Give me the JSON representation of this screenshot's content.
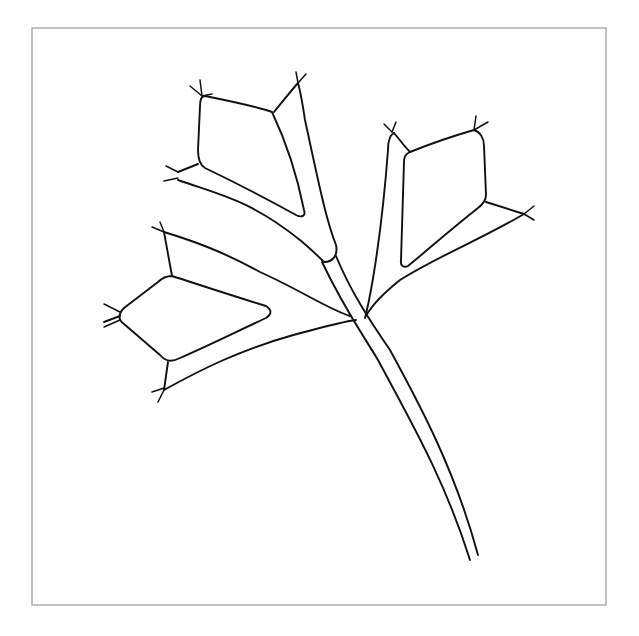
{
  "canvas": {
    "width": 639,
    "height": 636,
    "background": "#ffffff"
  },
  "frame": {
    "x": 32,
    "y": 28,
    "width": 574,
    "height": 577,
    "stroke": "#9a9a9a"
  },
  "drawing": {
    "subject": "line-drawing-of-plant-sprig-with-three-leaves",
    "ink_color": "#111111",
    "paths": {
      "stem_left": "M322 262 C345 310 360 330 378 360 C410 420 445 480 470 560",
      "stem_right": "M336 256 C350 290 368 318 390 350 C420 405 455 470 478 555",
      "upper_leaf_outer": "M178 180 C220 195 250 200 300 240 C312 250 320 258 324 262 C334 262 338 254 336 245 C326 220 318 180 305 120 C302 100 300 90 298 83",
      "upper_leaf_top_edge": "M298 83 C290 92 284 100 274 112",
      "upper_leaf_inner": "M205 96 C235 102 255 106 272 112 C290 150 300 190 304 210 C306 216 302 218 296 215 C260 195 230 180 205 168 C200 165 198 160 198 150 L200 106 C200 99 202 96 205 96 Z",
      "upper_leaf_left_join": "M198 164 L178 172",
      "right_leaf_outer": "M365 318 C372 290 382 230 388 150 C388 140 390 135 394 133",
      "right_leaf_top_edge": "M394 133 C400 140 404 146 410 152",
      "right_leaf_inner": "M410 152 C440 140 460 134 474 130 C480 132 484 138 484 146 L486 195 C486 200 482 205 478 208 C450 230 430 248 408 266 C404 268 400 266 401 260 L404 162 C404 156 406 154 410 152 Z",
      "right_leaf_right_join": "M486 202 L524 214",
      "right_leaf_lower_edge": "M524 214 C480 240 440 255 400 280 C385 292 372 305 366 316",
      "left_leaf_upper_edge": "M164 232 C190 240 220 250 260 272 C300 290 330 310 350 316",
      "left_leaf_upper_join": "M164 232 L172 276",
      "left_leaf_inner": "M172 276 C200 285 230 295 266 306 C272 310 272 314 266 318 C240 330 210 345 180 358 C172 362 166 362 160 355 L124 324 C118 320 118 314 124 308 L158 282 C162 278 166 276 172 276 Z",
      "left_leaf_lower_join": "M168 362 L164 390",
      "left_leaf_lower_edge": "M164 390 C200 370 240 350 290 336 C320 328 340 322 356 320",
      "left_leaf_left_join": "M120 316 L104 322"
    },
    "tips": [
      {
        "name": "upper-leaf-top-left-tip",
        "lines": [
          "M202 96 L190 86",
          "M202 96 L200 80",
          "M202 96 L212 94"
        ]
      },
      {
        "name": "upper-leaf-top-right-tip",
        "lines": [
          "M298 83 L296 72",
          "M298 83 L306 74"
        ]
      },
      {
        "name": "upper-leaf-left-tip",
        "lines": [
          "M178 172 L166 166",
          "M178 178 L164 181"
        ]
      },
      {
        "name": "right-leaf-top-left-tip",
        "lines": [
          "M392 132 L384 124",
          "M392 132 L396 122"
        ]
      },
      {
        "name": "right-leaf-top-right-tip",
        "lines": [
          "M474 130 L476 116",
          "M474 130 L488 122"
        ]
      },
      {
        "name": "right-leaf-right-tip",
        "lines": [
          "M524 214 L534 206",
          "M524 214 L534 220"
        ]
      },
      {
        "name": "left-leaf-top-tip",
        "lines": [
          "M164 232 L152 227",
          "M164 232 L160 222"
        ]
      },
      {
        "name": "left-leaf-left-tip",
        "lines": [
          "M120 312 L104 304",
          "M120 320 L104 327"
        ]
      },
      {
        "name": "left-leaf-bottom-tip",
        "lines": [
          "M164 388 L152 392",
          "M164 390 L158 402"
        ]
      }
    ]
  }
}
